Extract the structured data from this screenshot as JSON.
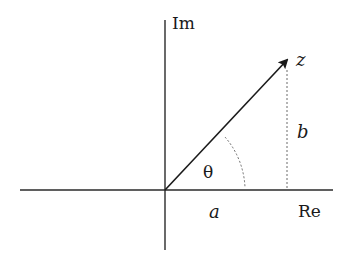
{
  "diagram": {
    "axes": {
      "real_label": "Re",
      "imag_label": "Im"
    },
    "point_label": "z",
    "real_part_label": "a",
    "imag_part_label": "b",
    "angle_label": "θ",
    "colors": {
      "line": "#2a2a2a",
      "dotted": "#6a6a6a",
      "text": "#1a1a1a",
      "background": "#ffffff"
    }
  }
}
